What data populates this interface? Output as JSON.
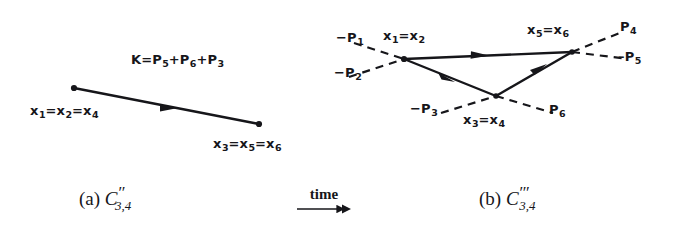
{
  "figure": {
    "background_color": "#ffffff",
    "ink_color": "#16161a",
    "panel_a": {
      "caption_prefix": "(a)",
      "caption_symbol": "C",
      "caption_primes": "′′",
      "caption_subscript": "3,4",
      "momentum_sum_label": {
        "lhs": "K",
        "equals": "=",
        "terms": [
          "P",
          "P",
          "P"
        ],
        "term_subscripts": [
          "5",
          "6",
          "3"
        ],
        "plus": "+"
      },
      "left_vertex_label": {
        "parts": [
          "x",
          "x",
          "x"
        ],
        "subscripts": [
          "1",
          "2",
          "4"
        ],
        "separator": "="
      },
      "right_vertex_label": {
        "parts": [
          "x",
          "x",
          "x"
        ],
        "subscripts": [
          "3",
          "5",
          "6"
        ],
        "separator": "="
      },
      "line": {
        "from": [
          74,
          88
        ],
        "to": [
          259,
          124
        ],
        "style": "solid",
        "arrow_at_fraction": 0.52,
        "endpoint_dots": true
      }
    },
    "panel_b": {
      "caption_prefix": "(b)",
      "caption_symbol": "C",
      "caption_primes": "′′′",
      "caption_subscript": "3,4",
      "vertices": {
        "left": {
          "x": 404,
          "y": 59,
          "label_parts": [
            "x",
            "x"
          ],
          "label_subscripts": [
            "1",
            "2"
          ],
          "separator": "="
        },
        "right": {
          "x": 572,
          "y": 52,
          "label_parts": [
            "x",
            "x"
          ],
          "label_subscripts": [
            "5",
            "6"
          ],
          "separator": "="
        },
        "bottom": {
          "x": 496,
          "y": 96,
          "label_parts": [
            "x",
            "x"
          ],
          "label_subscripts": [
            "3",
            "4"
          ],
          "separator": "="
        }
      },
      "external_legs": [
        {
          "name": "-P1",
          "symbol": "−P",
          "subscript": "1",
          "style": "dashed",
          "from": [
            356,
            44
          ],
          "to": [
            404,
            59
          ]
        },
        {
          "name": "-P2",
          "symbol": "−P",
          "subscript": "2",
          "style": "dashed",
          "from": [
            351,
            76
          ],
          "to": [
            404,
            59
          ]
        },
        {
          "name": "-P3",
          "symbol": "−P",
          "subscript": "3",
          "style": "dashed",
          "from": [
            443,
            112
          ],
          "to": [
            496,
            96
          ]
        },
        {
          "name": "P6",
          "symbol": "P",
          "subscript": "6",
          "style": "dashed",
          "from": [
            496,
            96
          ],
          "to": [
            551,
            112
          ]
        },
        {
          "name": "P4",
          "symbol": "P",
          "subscript": "4",
          "style": "dashed",
          "from": [
            572,
            52
          ],
          "to": [
            620,
            33
          ]
        },
        {
          "name": "P5",
          "symbol": "P",
          "subscript": "5",
          "style": "dashed",
          "from": [
            572,
            52
          ],
          "to": [
            625,
            58
          ]
        }
      ],
      "internal_lines": [
        {
          "name": "left-to-right-top",
          "from": [
            404,
            59
          ],
          "to": [
            572,
            52
          ],
          "style": "solid",
          "arrow_at_fraction": 0.45
        },
        {
          "name": "left-to-bottom",
          "from": [
            404,
            59
          ],
          "to": [
            496,
            96
          ],
          "style": "solid",
          "arrow_at_fraction": 0.47
        },
        {
          "name": "bottom-to-right",
          "from": [
            496,
            96
          ],
          "to": [
            572,
            52
          ],
          "style": "solid",
          "arrow_at_fraction": 0.52
        }
      ]
    },
    "time_axis": {
      "label": "time",
      "direction": "right",
      "arrow_from": [
        300,
        205
      ],
      "arrow_to": [
        350,
        205
      ]
    }
  }
}
